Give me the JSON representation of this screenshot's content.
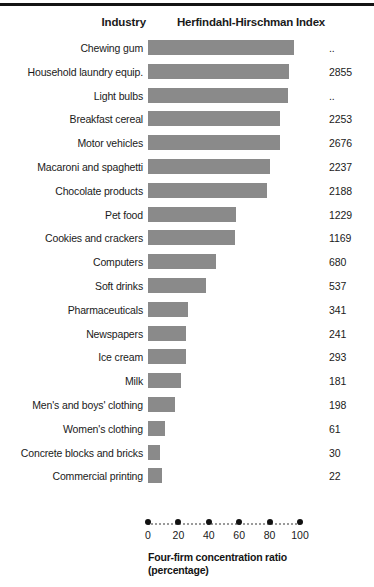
{
  "header": {
    "rule_color": "#141414",
    "industry_label": "Industry",
    "hhi_label": "Herfindahl-Hirschman Index"
  },
  "axis": {
    "caption_line1": "Four-firm concentration ratio",
    "caption_line2": "(percentage)",
    "ticks": [
      "0",
      "20",
      "40",
      "60",
      "80",
      "100"
    ],
    "tick_dot_color": "#111111",
    "dot_line_color": "#9a9a9a"
  },
  "style": {
    "bar_color": "#8a8a8a",
    "text_color": "#1a1a1a"
  },
  "chart_data": {
    "type": "bar",
    "orientation": "horizontal",
    "title": "Herfindahl-Hirschman Index",
    "xlabel": "Four-firm concentration ratio (percentage)",
    "ylabel": "Industry",
    "xlim": [
      0,
      100
    ],
    "grid": false,
    "legend": "none",
    "categories": [
      "Chewing gum",
      "Household laundry equip.",
      "Light bulbs",
      "Breakfast cereal",
      "Motor vehicles",
      "Macaroni and spaghetti",
      "Chocolate products",
      "Pet food",
      "Cookies and crackers",
      "Computers",
      "Soft drinks",
      "Pharmaceuticals",
      "Newspapers",
      "Ice cream",
      "Milk",
      "Men's and boys' clothing",
      "Women's clothing",
      "Concrete blocks and bricks",
      "Commercial printing"
    ],
    "values": [
      96,
      93,
      92,
      87,
      87,
      80,
      78,
      58,
      57,
      45,
      38,
      26,
      25,
      25,
      22,
      18,
      11,
      8,
      9
    ],
    "value_labels": [
      "..",
      "2855",
      "..",
      "2253",
      "2676",
      "2237",
      "2188",
      "1229",
      "1169",
      "680",
      "537",
      "341",
      "241",
      "293",
      "181",
      "198",
      "61",
      "30",
      "22"
    ],
    "value_label_header": "Herfindahl-Hirschman Index",
    "rows": [
      {
        "label": "Chewing gum",
        "ratio": 96,
        "hhi": ".."
      },
      {
        "label": "Household laundry equip.",
        "ratio": 93,
        "hhi": "2855"
      },
      {
        "label": "Light bulbs",
        "ratio": 92,
        "hhi": ".."
      },
      {
        "label": "Breakfast cereal",
        "ratio": 87,
        "hhi": "2253"
      },
      {
        "label": "Motor vehicles",
        "ratio": 87,
        "hhi": "2676"
      },
      {
        "label": "Macaroni and spaghetti",
        "ratio": 80,
        "hhi": "2237"
      },
      {
        "label": "Chocolate products",
        "ratio": 78,
        "hhi": "2188"
      },
      {
        "label": "Pet food",
        "ratio": 58,
        "hhi": "1229"
      },
      {
        "label": "Cookies and crackers",
        "ratio": 57,
        "hhi": "1169"
      },
      {
        "label": "Computers",
        "ratio": 45,
        "hhi": "680"
      },
      {
        "label": "Soft drinks",
        "ratio": 38,
        "hhi": "537"
      },
      {
        "label": "Pharmaceuticals",
        "ratio": 26,
        "hhi": "341"
      },
      {
        "label": "Newspapers",
        "ratio": 25,
        "hhi": "241"
      },
      {
        "label": "Ice cream",
        "ratio": 25,
        "hhi": "293"
      },
      {
        "label": "Milk",
        "ratio": 22,
        "hhi": "181"
      },
      {
        "label": "Men's and boys' clothing",
        "ratio": 18,
        "hhi": "198"
      },
      {
        "label": "Women's clothing",
        "ratio": 11,
        "hhi": "61"
      },
      {
        "label": "Concrete blocks and bricks",
        "ratio": 8,
        "hhi": "30"
      },
      {
        "label": "Commercial printing",
        "ratio": 9,
        "hhi": "22"
      }
    ]
  }
}
